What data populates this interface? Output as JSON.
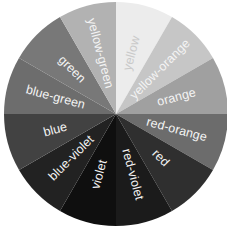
{
  "diagram": {
    "type": "color-wheel",
    "center": [
      116,
      114
    ],
    "radius": 112,
    "start_angle_deg": 0,
    "segments": [
      {
        "label": "yellow",
        "fill": "#ececec",
        "text": "#c9c9c9"
      },
      {
        "label": "yellow-orange",
        "fill": "#c6c6c6",
        "text": "#f4f4f4"
      },
      {
        "label": "orange",
        "fill": "#a0a0a0",
        "text": "#f4f4f4"
      },
      {
        "label": "red-orange",
        "fill": "#6c6c6c",
        "text": "#f4f4f4"
      },
      {
        "label": "red",
        "fill": "#2f2f2f",
        "text": "#f4f4f4"
      },
      {
        "label": "red-violet",
        "fill": "#1b1b1b",
        "text": "#f4f4f4"
      },
      {
        "label": "violet",
        "fill": "#0f0f0f",
        "text": "#f4f4f4"
      },
      {
        "label": "blue-violet",
        "fill": "#222222",
        "text": "#f4f4f4"
      },
      {
        "label": "blue",
        "fill": "#424242",
        "text": "#f4f4f4"
      },
      {
        "label": "blue-green",
        "fill": "#6d6d6d",
        "text": "#f4f4f4"
      },
      {
        "label": "green",
        "fill": "#787878",
        "text": "#f4f4f4"
      },
      {
        "label": "yellow-green",
        "fill": "#b2b2b2",
        "text": "#f4f4f4"
      }
    ]
  }
}
